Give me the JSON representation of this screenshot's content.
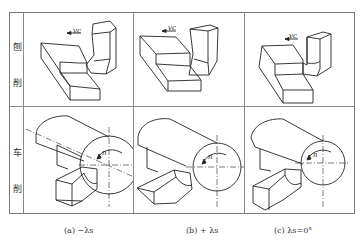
{
  "figure": {
    "rows": [
      {
        "label_top": "刨",
        "label_bottom": "削",
        "name": "planing"
      },
      {
        "label_top": "车",
        "label_bottom": "削",
        "name": "turning"
      }
    ],
    "columns": [
      {
        "caption": "(a) −λs",
        "case": "negative-inclination"
      },
      {
        "caption": "(b) + λs",
        "case": "positive-inclination"
      },
      {
        "caption": "(c) λs=0°",
        "case": "zero-inclination"
      }
    ],
    "annotations": {
      "cutting_speed": "vc",
      "rotation": "n"
    },
    "colors": {
      "line": "#222222",
      "grid": "#8a8a8a",
      "background": "#ffffff"
    }
  }
}
